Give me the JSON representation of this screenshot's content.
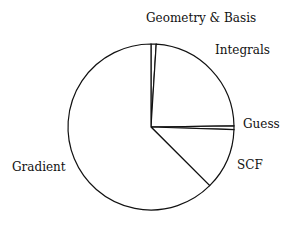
{
  "chart_data": {
    "type": "pie",
    "title": "",
    "start_angle": "top (12 o'clock), clockwise",
    "categories": [
      "Geometry & Basis",
      "Integrals",
      "Guess",
      "SCF",
      "Gradient"
    ],
    "values": [
      1.0,
      23.8,
      0.7,
      12.0,
      62.5
    ],
    "unit": "% of time",
    "colors": {
      "fill": "#ffffff",
      "stroke": "#111111"
    },
    "legend": "none (labels placed next to slices)"
  },
  "labels": {
    "geometry": "Geometry & Basis",
    "integrals": "Integrals",
    "guess": "Guess",
    "scf": "SCF",
    "gradient": "Gradient"
  }
}
